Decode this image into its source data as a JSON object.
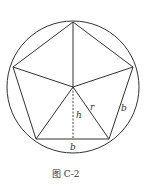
{
  "figure": {
    "caption": "图  C-2",
    "labels": {
      "height": "h",
      "radius": "r",
      "side_right": "b",
      "side_bottom": "b"
    },
    "shape": "regular pentagon inscribed in circle, center joined to vertices",
    "colors": {
      "stroke": "#333333",
      "background": "#ffffff"
    }
  }
}
